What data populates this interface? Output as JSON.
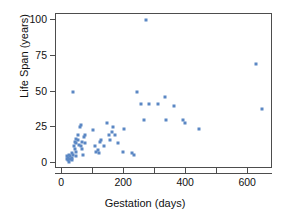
{
  "chart_data": {
    "type": "scatter",
    "title": "",
    "xlabel": "Gestation (days)",
    "ylabel": "Life Span (years)",
    "xlim": [
      -20,
      680
    ],
    "ylim": [
      -4,
      104
    ],
    "grid": false,
    "legend": "none",
    "marker_color": "#5b87c4",
    "axis_color": "#4d4d4d",
    "xticks": [
      0,
      100,
      200,
      300,
      400,
      500,
      600
    ],
    "xtick_labels": [
      "0",
      "",
      "200",
      "",
      "400",
      "",
      "600"
    ],
    "yticks": [
      0,
      25,
      50,
      75,
      100
    ],
    "ytick_labels": [
      "0",
      "25",
      "50",
      "75",
      "100"
    ],
    "series": [
      {
        "name": "animals",
        "x": [
          15,
          16,
          18,
          20,
          21,
          22,
          23,
          25,
          28,
          30,
          31,
          33,
          35,
          36,
          38,
          40,
          42,
          43,
          44,
          45,
          46,
          50,
          52,
          55,
          58,
          60,
          62,
          63,
          64,
          68,
          70,
          72,
          75,
          100,
          105,
          110,
          115,
          120,
          122,
          125,
          135,
          145,
          150,
          155,
          160,
          165,
          170,
          180,
          195,
          200,
          225,
          230,
          240,
          255,
          265,
          270,
          280,
          310,
          330,
          335,
          360,
          390,
          395,
          440,
          625,
          645
        ],
        "y": [
          5,
          3,
          2,
          4,
          1,
          3,
          6,
          5,
          3,
          2,
          7,
          4,
          6,
          50,
          12,
          10,
          15,
          17,
          14,
          8,
          5,
          20,
          16,
          13,
          25,
          27,
          12,
          10,
          15,
          6,
          18,
          14,
          20,
          23,
          12,
          8,
          9,
          7,
          15,
          16,
          12,
          28,
          20,
          16,
          22,
          25,
          20,
          14,
          8,
          24,
          7,
          6,
          50,
          41,
          30,
          100,
          41,
          41,
          46,
          30,
          40,
          30,
          28,
          24,
          69,
          38
        ]
      }
    ]
  },
  "axes": {
    "x": {
      "label": "Gestation (days)",
      "ticks": [
        {
          "value": 0,
          "label": "0"
        },
        {
          "value": 100,
          "label": ""
        },
        {
          "value": 200,
          "label": "200"
        },
        {
          "value": 300,
          "label": ""
        },
        {
          "value": 400,
          "label": "400"
        },
        {
          "value": 500,
          "label": ""
        },
        {
          "value": 600,
          "label": "600"
        }
      ]
    },
    "y": {
      "label": "Life Span (years)",
      "ticks": [
        {
          "value": 0,
          "label": "0"
        },
        {
          "value": 25,
          "label": "25"
        },
        {
          "value": 50,
          "label": "50"
        },
        {
          "value": 75,
          "label": "75"
        },
        {
          "value": 100,
          "label": "100"
        }
      ]
    }
  }
}
